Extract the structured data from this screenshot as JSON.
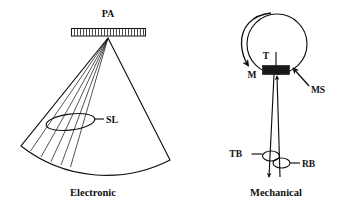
{
  "figure": {
    "background_color": "#ffffff",
    "line_color": "#1a1a1a",
    "text_color": "#111111"
  },
  "panels": [
    {
      "id": "electronic",
      "caption": "Electronic",
      "labels": [
        {
          "key": "PA",
          "text": "PA",
          "meaning": "phased array"
        },
        {
          "key": "SL",
          "text": "SL",
          "meaning": "scan lines"
        }
      ],
      "array": {
        "elements": 24
      },
      "sector": {
        "beam_lines": 5,
        "half_angle_deg": 37
      }
    },
    {
      "id": "mechanical",
      "caption": "Mechanical",
      "labels": [
        {
          "key": "T",
          "text": "T",
          "meaning": "transducer"
        },
        {
          "key": "M",
          "text": "M",
          "meaning": "motor rotation"
        },
        {
          "key": "MS",
          "text": "MS",
          "meaning": "mechanical sector housing"
        },
        {
          "key": "TB",
          "text": "TB",
          "meaning": "transmitted beam"
        },
        {
          "key": "RB",
          "text": "RB",
          "meaning": "received beam"
        }
      ]
    }
  ]
}
